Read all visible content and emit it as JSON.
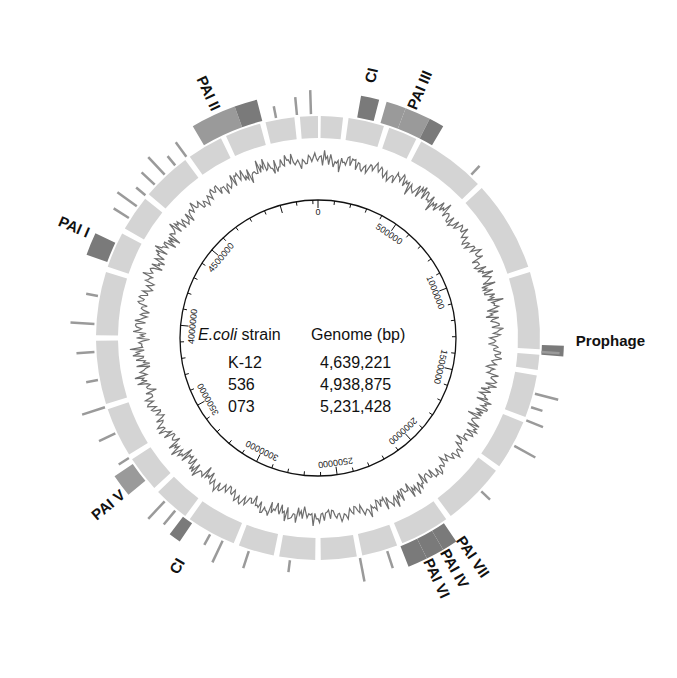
{
  "figure": {
    "type": "circular-genome-map",
    "center": {
      "x": 318,
      "y": 338
    },
    "colors": {
      "backbone": "#d4d4d4",
      "island_dark": "#7a7a7a",
      "island_mid": "#9a9a9a",
      "skew": "#6e6e6e",
      "scale_line": "#111111"
    }
  },
  "table": {
    "header_strain_italic": "E.coli",
    "header_strain": " strain",
    "header_genome": "Genome (bp)",
    "rows": [
      {
        "strain": "K-12",
        "genome": "4,639,221"
      },
      {
        "strain": "536",
        "genome": "4,938,875"
      },
      {
        "strain": "073",
        "genome": "5,231,428"
      }
    ]
  },
  "scale": {
    "max_bp": 5231428,
    "tick_labels": [
      "0",
      "500000",
      "1000000",
      "1500000",
      "2000000",
      "2500000",
      "3000000",
      "3500000",
      "4000000",
      "4500000"
    ]
  },
  "labels": [
    {
      "text": "PAI II",
      "pos": 0.93
    },
    {
      "text": "CI",
      "pos": 0.035
    },
    {
      "text": "PAI III",
      "pos": 0.065
    },
    {
      "text": "PAI I",
      "pos": 0.815
    },
    {
      "text": "Prophage",
      "pos": 0.255
    },
    {
      "text": "PAI VII",
      "pos": 0.405
    },
    {
      "text": "PAI IV",
      "pos": 0.418
    },
    {
      "text": "PAI VI",
      "pos": 0.43
    },
    {
      "text": "PAI V",
      "pos": 0.64
    },
    {
      "text": "CI",
      "pos": 0.585
    }
  ]
}
